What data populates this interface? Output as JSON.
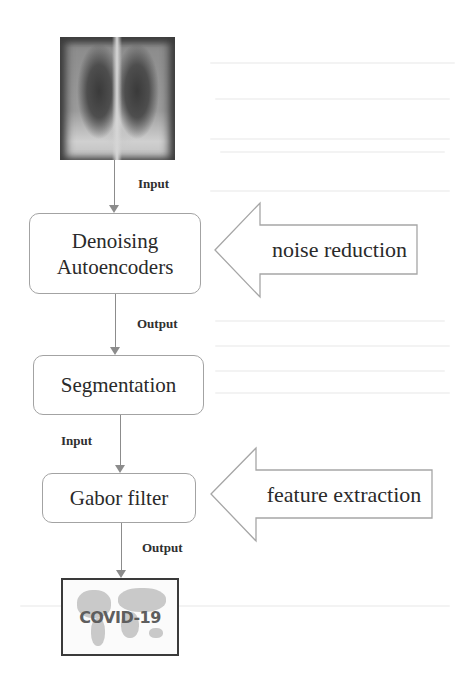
{
  "diagram": {
    "input_image": {
      "label": "chest-xray",
      "description": "Chest X-ray image"
    },
    "steps": [
      {
        "id": "denoising",
        "lines": [
          "Denoising",
          "Autoencoders"
        ]
      },
      {
        "id": "segmentation",
        "lines": [
          "Segmentation"
        ]
      },
      {
        "id": "gabor",
        "lines": [
          "Gabor filter"
        ]
      }
    ],
    "connectors": [
      {
        "from": "xray",
        "to": "denoising",
        "label": "Input"
      },
      {
        "from": "denoising",
        "to": "segmentation",
        "label": "Output"
      },
      {
        "from": "segmentation",
        "to": "gabor",
        "label": "Input"
      },
      {
        "from": "gabor",
        "to": "covid",
        "label": "Output"
      }
    ],
    "side_arrows": [
      {
        "target": "denoising",
        "label": "noise reduction"
      },
      {
        "target": "gabor",
        "label": "feature extraction"
      }
    ],
    "output_image": {
      "label": "COVID-19"
    }
  },
  "colors": {
    "line": "#8c8c8c",
    "box_border": "#a3a3a3",
    "text": "#2a2a2a",
    "background": "#ffffff"
  }
}
